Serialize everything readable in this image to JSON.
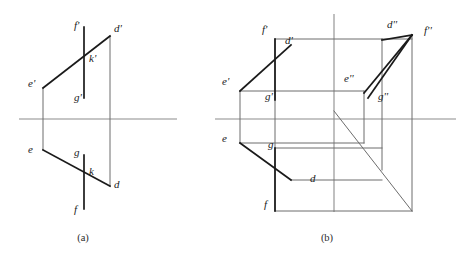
{
  "figure": {
    "caption_a": "(a)",
    "caption_b": "(b)",
    "background_color": "#ffffff",
    "heavy_line_color": "#1a1a1a",
    "thin_line_color": "#6d6d6d",
    "axis_line_color": "#8c8c8c",
    "label_color": "#1a1a1a"
  },
  "panel_a": {
    "name": "orthographic-projection-panel",
    "labels": [
      {
        "id": "f-prime",
        "text": "f'",
        "x": 74,
        "y": 29
      },
      {
        "id": "d-prime",
        "text": "d'",
        "x": 114,
        "y": 32
      },
      {
        "id": "k-prime",
        "text": "k'",
        "x": 89,
        "y": 62
      },
      {
        "id": "e-prime",
        "text": "e'",
        "x": 28,
        "y": 87
      },
      {
        "id": "g-prime",
        "text": "g'",
        "x": 74,
        "y": 101
      },
      {
        "id": "e",
        "text": "e",
        "x": 28,
        "y": 153
      },
      {
        "id": "g",
        "text": "g",
        "x": 74,
        "y": 156
      },
      {
        "id": "k",
        "text": "k",
        "x": 89,
        "y": 175
      },
      {
        "id": "d",
        "text": "d",
        "x": 114,
        "y": 188
      },
      {
        "id": "f",
        "text": "f",
        "x": 74,
        "y": 213
      }
    ],
    "axis": {
      "x1": 19,
      "y1": 119,
      "x2": 177,
      "y2": 119
    },
    "heavy_segments": [
      {
        "id": "seg-e-prime-d-prime",
        "x1": 43,
        "y1": 88,
        "x2": 110,
        "y2": 36
      },
      {
        "id": "seg-e-d",
        "x1": 43,
        "y1": 150,
        "x2": 110,
        "y2": 186
      },
      {
        "id": "seg-f-prime-g-prime",
        "x1": 84,
        "y1": 27,
        "x2": 84,
        "y2": 98
      },
      {
        "id": "seg-f-g",
        "x1": 84,
        "y1": 155,
        "x2": 84,
        "y2": 209
      }
    ],
    "thin_segments": [
      {
        "id": "seg-e-prime-e-vertical",
        "x1": 43,
        "y1": 88,
        "x2": 43,
        "y2": 150
      },
      {
        "id": "seg-d-prime-d-vertical",
        "x1": 110,
        "y1": 36,
        "x2": 110,
        "y2": 186
      }
    ]
  },
  "panel_b": {
    "name": "three-dimensional-projection-box-panel",
    "labels": [
      {
        "id": "f-prime-b",
        "text": "f'",
        "x": 262,
        "y": 33
      },
      {
        "id": "d-prime-b",
        "text": "d'",
        "x": 285,
        "y": 44
      },
      {
        "id": "d-double-b",
        "text": "d''",
        "x": 387,
        "y": 28
      },
      {
        "id": "f-double-b",
        "text": "f''",
        "x": 424,
        "y": 34
      },
      {
        "id": "e-prime-b",
        "text": "e'",
        "x": 222,
        "y": 85
      },
      {
        "id": "e-double-b",
        "text": "e''",
        "x": 344,
        "y": 82
      },
      {
        "id": "g-prime-b",
        "text": "g'",
        "x": 265,
        "y": 100
      },
      {
        "id": "g-double-b",
        "text": "g''",
        "x": 378,
        "y": 100
      },
      {
        "id": "e-b",
        "text": "e",
        "x": 222,
        "y": 142
      },
      {
        "id": "g-b",
        "text": "g",
        "x": 268,
        "y": 148
      },
      {
        "id": "d-b",
        "text": "d",
        "x": 310,
        "y": 182
      },
      {
        "id": "f-b",
        "text": "f",
        "x": 264,
        "y": 208
      }
    ],
    "axis": {
      "x1": 215,
      "y1": 119,
      "x2": 456,
      "y2": 119
    },
    "vertical_axis": {
      "x1": 334,
      "y1": 14,
      "x2": 334,
      "y2": 212
    },
    "heavy_segments": [
      {
        "id": "b-seg-e-prime-d-prime",
        "x1": 240,
        "y1": 91,
        "x2": 291,
        "y2": 45
      },
      {
        "id": "b-seg-f-prime-g-prime",
        "x1": 275,
        "y1": 39,
        "x2": 275,
        "y2": 100
      },
      {
        "id": "b-seg-e-d",
        "x1": 240,
        "y1": 143,
        "x2": 291,
        "y2": 180
      },
      {
        "id": "b-seg-f-g",
        "x1": 275,
        "y1": 148,
        "x2": 275,
        "y2": 211
      },
      {
        "id": "b-seg-e-double-d-double",
        "x1": 364,
        "y1": 93,
        "x2": 412,
        "y2": 35
      },
      {
        "id": "b-seg-f-double-g-double",
        "x1": 412,
        "y1": 35,
        "x2": 368,
        "y2": 98
      },
      {
        "id": "b-seg-d-double-f-double",
        "x1": 382,
        "y1": 40,
        "x2": 412,
        "y2": 35
      }
    ],
    "thin_segments": [
      {
        "id": "b-box-top-left-edge",
        "x1": 275,
        "y1": 39,
        "x2": 382,
        "y2": 39
      },
      {
        "id": "b-box-left-vertical",
        "x1": 240,
        "y1": 91,
        "x2": 240,
        "y2": 143
      },
      {
        "id": "b-box-outer-left-top",
        "x1": 275,
        "y1": 39,
        "x2": 275,
        "y2": 211
      },
      {
        "id": "b-inner-panel-top",
        "x1": 240,
        "y1": 91,
        "x2": 364,
        "y2": 91
      },
      {
        "id": "b-inner-panel-bottom",
        "x1": 240,
        "y1": 143,
        "x2": 364,
        "y2": 143
      },
      {
        "id": "b-right-vertical",
        "x1": 412,
        "y1": 35,
        "x2": 412,
        "y2": 211
      },
      {
        "id": "b-bottom-horizontal",
        "x1": 275,
        "y1": 211,
        "x2": 412,
        "y2": 211
      },
      {
        "id": "b-diagonal-main",
        "x1": 334,
        "y1": 111,
        "x2": 412,
        "y2": 211
      },
      {
        "id": "b-e-double-vertical",
        "x1": 364,
        "y1": 91,
        "x2": 364,
        "y2": 143
      },
      {
        "id": "b-top-right-horizontal",
        "x1": 382,
        "y1": 39,
        "x2": 412,
        "y2": 39
      },
      {
        "id": "b-d-double-vertical",
        "x1": 382,
        "y1": 39,
        "x2": 382,
        "y2": 170
      },
      {
        "id": "b-lower-inner-top",
        "x1": 275,
        "y1": 148,
        "x2": 382,
        "y2": 148
      },
      {
        "id": "b-lower-inner-bottom",
        "x1": 291,
        "y1": 180,
        "x2": 382,
        "y2": 180
      }
    ]
  }
}
